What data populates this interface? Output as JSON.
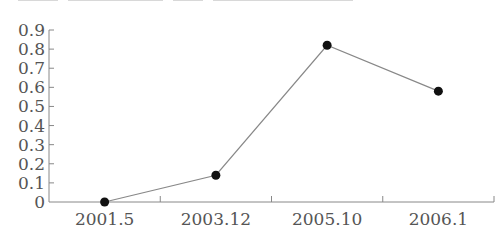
{
  "chart_data": {
    "type": "line",
    "title": "",
    "xlabel": "",
    "ylabel": "",
    "categories": [
      "2001.5",
      "2003.12",
      "2005.10",
      "2006.1"
    ],
    "series": [
      {
        "name": "series-1",
        "values": [
          0.0,
          0.14,
          0.82,
          0.58
        ]
      }
    ],
    "ylim": [
      0,
      0.9
    ],
    "yticks": [
      "0",
      "0.1",
      "0.2",
      "0.3",
      "0.4",
      "0.5",
      "0.6",
      "0.7",
      "0.8",
      "0.9"
    ],
    "grid": false,
    "legend": "none",
    "marker": "filled-circle",
    "line_color": "#888888",
    "marker_color": "#111111",
    "axis_color": "#888888"
  }
}
